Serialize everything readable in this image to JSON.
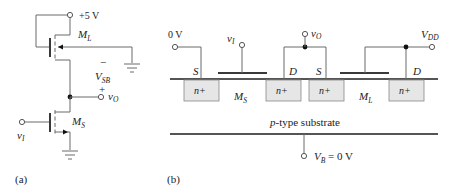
{
  "figure_a": {
    "caption": "(a)",
    "supply_label": "+5 V",
    "load_transistor": {
      "name": "M",
      "sub": "L"
    },
    "switch_transistor": {
      "name": "M",
      "sub": "S"
    },
    "vsb": {
      "minus": "−",
      "name": "V",
      "sub": "SB",
      "plus": "+"
    },
    "output": {
      "name": "v",
      "sub": "O"
    },
    "input": {
      "name": "v",
      "sub": "I"
    }
  },
  "figure_b": {
    "caption": "(b)",
    "left_source_voltage": "0 V",
    "input": {
      "name": "v",
      "sub": "I"
    },
    "output": {
      "name": "v",
      "sub": "O"
    },
    "supply": {
      "name": "V",
      "sub": "DD"
    },
    "terminals": [
      "S",
      "D",
      "S",
      "D"
    ],
    "diffusion_label": "n+",
    "ms": {
      "name": "M",
      "sub": "S"
    },
    "ml": {
      "name": "M",
      "sub": "L"
    },
    "substrate_label": "p-type substrate",
    "substrate_prefix": "p",
    "substrate_rest": "-type substrate",
    "body": {
      "name": "V",
      "sub": "B",
      "value": " = 0 V"
    }
  },
  "colors": {
    "wire": "#6a6a6a",
    "diffusion_fill": "#e6e6e6"
  }
}
